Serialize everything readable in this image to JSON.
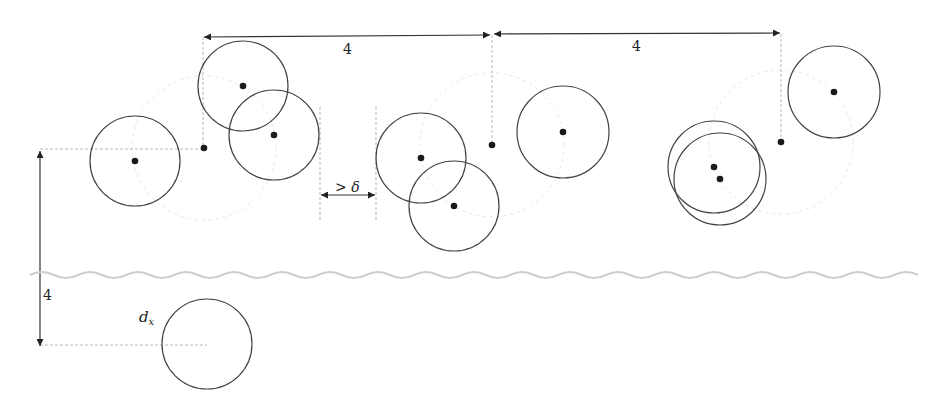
{
  "diagram": {
    "title": "",
    "colors": {
      "stroke": "#444444",
      "dot": "#1a1a1a",
      "dashed": "#b8b8b8",
      "wavy": "#cfcfcf",
      "text": "#222222"
    },
    "labels": {
      "top_span_1": "4",
      "top_span_2": "4",
      "gap": "> δ",
      "vertical_span": "4",
      "dx_label": "d",
      "dx_subscript": "x"
    },
    "circles": [
      {
        "id": "c1",
        "cx": 135,
        "cy": 161,
        "r": 45,
        "dot": true
      },
      {
        "id": "c2",
        "cx": 243,
        "cy": 86,
        "r": 45,
        "dot": true
      },
      {
        "id": "c3",
        "cx": 274,
        "cy": 135,
        "r": 45,
        "dot": true
      },
      {
        "id": "c4",
        "cx": 421,
        "cy": 158,
        "r": 45,
        "dot": true
      },
      {
        "id": "c5",
        "cx": 454,
        "cy": 206,
        "r": 45,
        "dot": true
      },
      {
        "id": "c6",
        "cx": 563,
        "cy": 132,
        "r": 46,
        "dot": true
      },
      {
        "id": "c7",
        "cx": 714,
        "cy": 167,
        "r": 46,
        "dot": true
      },
      {
        "id": "c8",
        "cx": 720,
        "cy": 179,
        "r": 46,
        "dot": true
      },
      {
        "id": "c9",
        "cx": 834,
        "cy": 92,
        "r": 46,
        "dot": true
      },
      {
        "id": "c10",
        "cx": 207,
        "cy": 344,
        "r": 45,
        "dot": false
      }
    ],
    "reference_points": [
      {
        "id": "p1",
        "x": 204,
        "y": 148
      },
      {
        "id": "p2",
        "x": 492,
        "y": 145
      },
      {
        "id": "p3",
        "x": 781,
        "y": 142
      }
    ]
  }
}
